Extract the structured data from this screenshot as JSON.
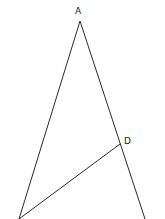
{
  "diagram": {
    "type": "geometry-triangle",
    "stroke_color": "#2a2a2a",
    "points": {
      "A": {
        "label": "A",
        "x": 80,
        "y": 21
      },
      "B": {
        "label": "",
        "x": 19,
        "y": 219
      },
      "C": {
        "label": "",
        "x": 145,
        "y": 219
      },
      "D": {
        "label": "D",
        "x": 120,
        "y": 144
      }
    },
    "segments": [
      {
        "from": "A",
        "to": "B"
      },
      {
        "from": "A",
        "to": "C"
      },
      {
        "from": "B",
        "to": "D"
      }
    ]
  }
}
